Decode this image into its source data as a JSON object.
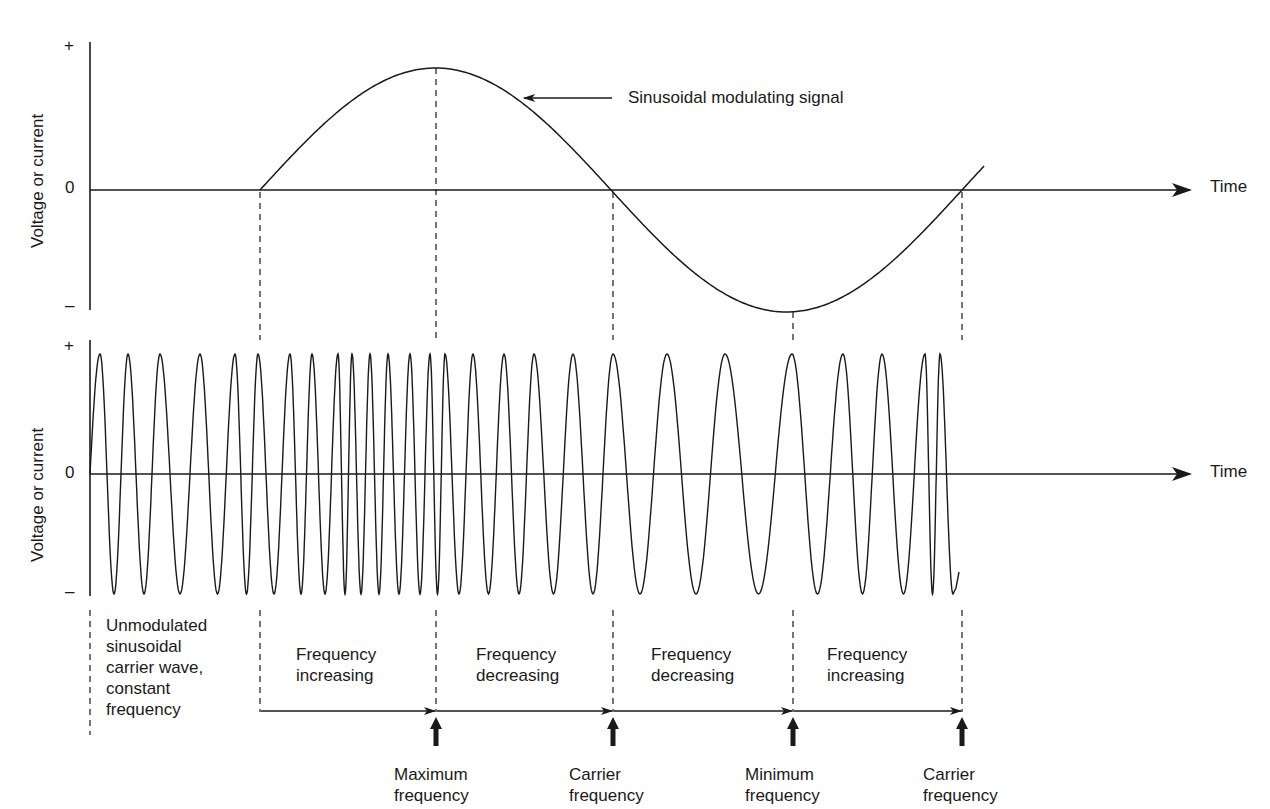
{
  "diagram": {
    "type": "frequency_modulation_waveforms",
    "colors": {
      "line": "#1a1a1a",
      "background": "#ffffff"
    },
    "top_panel": {
      "y_axis_label": "Voltage or current",
      "ticks": {
        "plus": "+",
        "zero": "0",
        "minus": "–"
      },
      "x_axis_label": "Time",
      "signal_label": "Sinusoidal modulating signal",
      "signal_segments": [
        {
          "from_x": 90,
          "to_x": 260,
          "shape": "flat_zero"
        },
        {
          "from_x": 260,
          "to_x": 962,
          "shape": "sine_one_cycle",
          "peak_x": 436,
          "trough_x": 793
        }
      ]
    },
    "bottom_panel": {
      "y_axis_label": "Voltage or current",
      "ticks": {
        "plus": "+",
        "zero": "0",
        "minus": "–"
      },
      "x_axis_label": "Time",
      "carrier_peak_x": [
        100,
        128,
        160,
        200,
        235,
        258,
        290,
        312,
        338,
        352,
        370,
        388,
        410,
        430,
        445,
        473,
        504,
        534,
        573,
        613,
        667,
        725,
        792,
        843,
        882,
        925,
        940
      ]
    },
    "markers_x": [
      260,
      436,
      613,
      793,
      962
    ],
    "regions": [
      {
        "label": "Unmodulated\nsinusoidal\ncarrier wave,\nconstant\nfrequency"
      },
      {
        "label": "Frequency\nincreasing"
      },
      {
        "label": "Frequency\ndecreasing"
      },
      {
        "label": "Frequency\ndecreasing"
      },
      {
        "label": "Frequency\nincreasing"
      }
    ],
    "points": [
      {
        "label": "Maximum\nfrequency"
      },
      {
        "label": "Carrier\nfrequency"
      },
      {
        "label": "Minimum\nfrequency"
      },
      {
        "label": "Carrier\nfrequency"
      }
    ]
  }
}
